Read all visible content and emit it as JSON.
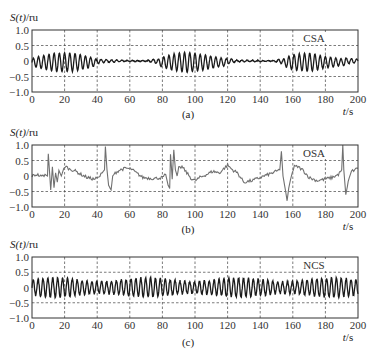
{
  "figure": {
    "subplot_labels": [
      "(a)",
      "(b)",
      "(c)"
    ]
  },
  "chart_data": [
    {
      "type": "line",
      "title": "",
      "tag": "CSA",
      "subplot_label": "(a)",
      "xlabel": "t/s",
      "ylabel": "S(t)/ru",
      "xlim": [
        0,
        200
      ],
      "ylim": [
        -1.0,
        1.0
      ],
      "xticks": [
        0,
        20,
        40,
        60,
        80,
        100,
        120,
        140,
        160,
        180,
        200
      ],
      "yticks": [
        1.0,
        0.5,
        0,
        -0.5,
        -1.0
      ],
      "ytick_labels": [
        "1.0",
        "0.5",
        "0",
        "−0.5",
        "−1.0"
      ],
      "grid": true,
      "color": "#1a1a1a",
      "description": "Central sleep apnea: crescendo-decrescendo oscillation bursts (amplitude ~0.3) separated by flat apnea segments near 0",
      "envelope": [
        {
          "t": 0,
          "amp": 0.12
        },
        {
          "t": 5,
          "amp": 0.2
        },
        {
          "t": 15,
          "amp": 0.3
        },
        {
          "t": 25,
          "amp": 0.3
        },
        {
          "t": 35,
          "amp": 0.18
        },
        {
          "t": 42,
          "amp": 0.06
        },
        {
          "t": 55,
          "amp": 0.02
        },
        {
          "t": 70,
          "amp": 0.01
        },
        {
          "t": 75,
          "amp": 0.06
        },
        {
          "t": 85,
          "amp": 0.25
        },
        {
          "t": 95,
          "amp": 0.33
        },
        {
          "t": 105,
          "amp": 0.25
        },
        {
          "t": 118,
          "amp": 0.12
        },
        {
          "t": 125,
          "amp": 0.03
        },
        {
          "t": 148,
          "amp": 0.01
        },
        {
          "t": 152,
          "amp": 0.06
        },
        {
          "t": 160,
          "amp": 0.25
        },
        {
          "t": 170,
          "amp": 0.3
        },
        {
          "t": 180,
          "amp": 0.18
        },
        {
          "t": 195,
          "amp": 0.08
        },
        {
          "t": 200,
          "amp": 0.06
        }
      ],
      "oscillation_period_s": 3.2
    },
    {
      "type": "line",
      "title": "",
      "tag": "OSA",
      "subplot_label": "(b)",
      "xlabel": "t/s",
      "ylabel": "S(t)/ru",
      "xlim": [
        0,
        200
      ],
      "ylim": [
        -1.0,
        1.0
      ],
      "xticks": [
        0,
        20,
        40,
        60,
        80,
        100,
        120,
        140,
        160,
        180,
        200
      ],
      "yticks": [
        1.0,
        0.5,
        0,
        -0.5,
        -1.0
      ],
      "ytick_labels": [
        "1.0",
        "0.5",
        "0",
        "−0.5",
        "−1.0"
      ],
      "grid": true,
      "color": "#707070",
      "description": "Obstructive sleep apnea: slow baseline wander with sharp spikes at event terminations",
      "points": [
        [
          0,
          0.0
        ],
        [
          3,
          0.05
        ],
        [
          6,
          -0.02
        ],
        [
          8,
          0.05
        ],
        [
          9.5,
          0.0
        ],
        [
          10,
          0.72
        ],
        [
          10.8,
          0.1
        ],
        [
          11.5,
          -0.45
        ],
        [
          12.5,
          0.3
        ],
        [
          13.5,
          -0.38
        ],
        [
          14.5,
          0.1
        ],
        [
          15.5,
          -0.2
        ],
        [
          16.5,
          0.18
        ],
        [
          18,
          0.0
        ],
        [
          19.5,
          0.25
        ],
        [
          21,
          0.3
        ],
        [
          23,
          0.22
        ],
        [
          26,
          0.18
        ],
        [
          30,
          0.05
        ],
        [
          34,
          -0.05
        ],
        [
          38,
          -0.1
        ],
        [
          41,
          -0.05
        ],
        [
          43,
          0.1
        ],
        [
          44.5,
          0.2
        ],
        [
          45,
          0.95
        ],
        [
          46,
          0.2
        ],
        [
          47,
          -0.3
        ],
        [
          48.5,
          -0.45
        ],
        [
          49.5,
          0.0
        ],
        [
          51,
          0.1
        ],
        [
          54,
          0.2
        ],
        [
          58,
          0.25
        ],
        [
          61,
          0.22
        ],
        [
          64,
          0.1
        ],
        [
          68,
          -0.05
        ],
        [
          75,
          -0.08
        ],
        [
          80,
          -0.05
        ],
        [
          82,
          0.05
        ],
        [
          83.5,
          -0.3
        ],
        [
          84.5,
          -0.4
        ],
        [
          85,
          0.7
        ],
        [
          86,
          -0.1
        ],
        [
          87,
          0.85
        ],
        [
          88,
          0.2
        ],
        [
          89,
          0.0
        ],
        [
          90,
          0.25
        ],
        [
          92,
          0.3
        ],
        [
          95,
          0.1
        ],
        [
          98,
          -0.1
        ],
        [
          100,
          -0.15
        ],
        [
          103,
          -0.05
        ],
        [
          107,
          0.05
        ],
        [
          111,
          0.15
        ],
        [
          115,
          0.1
        ],
        [
          120,
          0.35
        ],
        [
          123,
          0.2
        ],
        [
          126,
          0.1
        ],
        [
          130,
          -0.2
        ],
        [
          135,
          -0.15
        ],
        [
          140,
          -0.05
        ],
        [
          145,
          0.05
        ],
        [
          150,
          0.15
        ],
        [
          152,
          0.2
        ],
        [
          153,
          0.8
        ],
        [
          154,
          0.0
        ],
        [
          155,
          -0.3
        ],
        [
          156.5,
          -0.8
        ],
        [
          157.5,
          -0.4
        ],
        [
          159,
          0.0
        ],
        [
          161,
          0.3
        ],
        [
          163,
          0.3
        ],
        [
          166,
          0.2
        ],
        [
          170,
          -0.05
        ],
        [
          175,
          -0.15
        ],
        [
          180,
          -0.1
        ],
        [
          184,
          -0.05
        ],
        [
          188,
          0.05
        ],
        [
          190,
          0.2
        ],
        [
          190.7,
          1.0
        ],
        [
          191.3,
          0.2
        ],
        [
          192.5,
          -0.6
        ],
        [
          194,
          -0.2
        ],
        [
          196,
          0.15
        ],
        [
          198,
          0.2
        ],
        [
          200,
          0.25
        ]
      ]
    },
    {
      "type": "line",
      "title": "",
      "tag": "NCS",
      "subplot_label": "(c)",
      "xlabel": "t/s",
      "ylabel": "S(t)/ru",
      "xlim": [
        0,
        200
      ],
      "ylim": [
        -1.0,
        1.0
      ],
      "xticks": [
        0,
        20,
        40,
        60,
        80,
        100,
        120,
        140,
        160,
        180,
        200
      ],
      "yticks": [
        1.0,
        0.5,
        0,
        -0.5,
        -1.0
      ],
      "ytick_labels": [
        "1.0",
        "0.5",
        "0",
        "−0.5",
        "−1.0"
      ],
      "grid": true,
      "color": "#1a1a1a",
      "description": "Normal/no-apnea control signal: steady regular oscillation with amplitude ~0.3 throughout",
      "amplitude": 0.3,
      "oscillation_period_s": 3.0
    }
  ],
  "labels": {
    "ylabel_var": "S(t)",
    "ylabel_unit": "/ru",
    "xlabel": "t/s"
  }
}
